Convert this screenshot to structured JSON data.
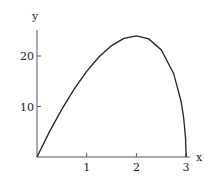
{
  "chart_data": {
    "type": "line",
    "title": "",
    "xlabel": "x",
    "ylabel": "y",
    "xlim": [
      0,
      3
    ],
    "ylim": [
      0,
      25
    ],
    "grid": false,
    "legend": null,
    "x_ticks": [
      "1",
      "2",
      "3"
    ],
    "y_ticks": [
      "10",
      "20"
    ],
    "series": [
      {
        "name": "curve",
        "x": [
          0,
          0.25,
          0.5,
          0.75,
          1,
          1.25,
          1.5,
          1.75,
          2,
          2.25,
          2.5,
          2.75,
          2.9,
          2.95,
          2.99,
          3
        ],
        "y": [
          0,
          4.97,
          9.49,
          13.5,
          16.97,
          19.84,
          22.05,
          23.48,
          24,
          23.38,
          21.21,
          16.5,
          11.0,
          7.92,
          3.59,
          0
        ]
      }
    ],
    "colors": {
      "line": "#222222",
      "axis": "#555555"
    }
  }
}
